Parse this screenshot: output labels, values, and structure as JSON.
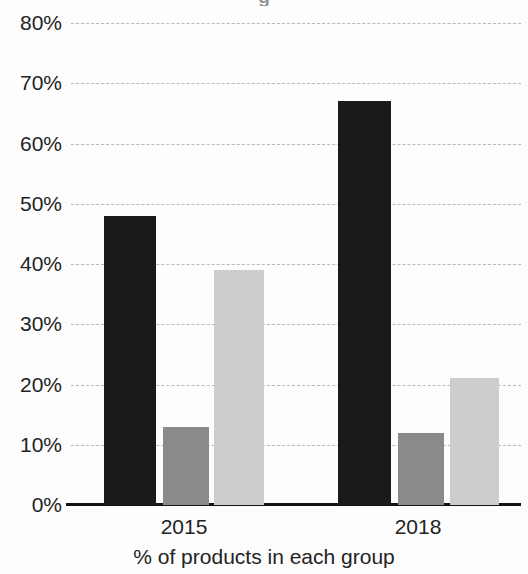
{
  "chart_data": {
    "type": "bar",
    "title": "",
    "cropped_title_fragment": "g",
    "xlabel": "% of products in each group",
    "ylabel": "",
    "categories": [
      "2015",
      "2018"
    ],
    "ylim": [
      0,
      80
    ],
    "ytick_labels": [
      "80%",
      "70%",
      "60%",
      "50%",
      "40%",
      "30%",
      "20%",
      "10%",
      "0%"
    ],
    "ytick_values": [
      80,
      70,
      60,
      50,
      40,
      30,
      20,
      10,
      0
    ],
    "ygrid": true,
    "grid_style": "dashed",
    "legend": "none",
    "value_suffix": "%",
    "series": [
      {
        "name": "series-1",
        "color": "#1a1a1a",
        "values": [
          48,
          67
        ]
      },
      {
        "name": "series-2",
        "color": "#8a8a8a",
        "values": [
          13,
          12
        ]
      },
      {
        "name": "series-3",
        "color": "#cdcdcd",
        "values": [
          39,
          21
        ]
      }
    ]
  },
  "geometry": {
    "bar_pixel_layout": [
      {
        "left": 104,
        "width": 52,
        "series": 0,
        "category": 0
      },
      {
        "left": 163,
        "width": 46,
        "series": 1,
        "category": 0
      },
      {
        "left": 214,
        "width": 50,
        "series": 2,
        "category": 0
      },
      {
        "left": 338,
        "width": 53,
        "series": 0,
        "category": 1
      },
      {
        "left": 398,
        "width": 46,
        "series": 1,
        "category": 1
      },
      {
        "left": 450,
        "width": 49,
        "series": 2,
        "category": 1
      }
    ],
    "category_label_centers": [
      184,
      418
    ]
  }
}
